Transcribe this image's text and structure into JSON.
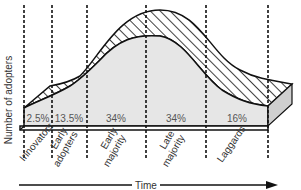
{
  "diagram": {
    "y_axis_label": "Number of adopters",
    "x_axis_label": "Time",
    "segments": [
      {
        "name": "Innovators",
        "label_lines": [
          "Innovators"
        ],
        "percent": "2.5%"
      },
      {
        "name": "Early adopters",
        "label_lines": [
          "Early",
          "adopters"
        ],
        "percent": "13.5%"
      },
      {
        "name": "Early majority",
        "label_lines": [
          "Early",
          "majority"
        ],
        "percent": "34%"
      },
      {
        "name": "Late majority",
        "label_lines": [
          "Late",
          "majority"
        ],
        "percent": "34%"
      },
      {
        "name": "Laggards",
        "label_lines": [
          "Laggards"
        ],
        "percent": "16%"
      }
    ],
    "colors": {
      "curve_fill": "#e6e6e6",
      "stroke": "#111111",
      "side_face": "#cfcfcf",
      "label_text": "#555555"
    }
  }
}
